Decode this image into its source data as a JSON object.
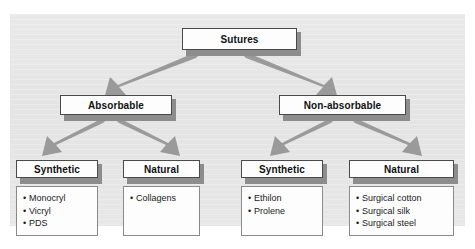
{
  "figure": {
    "root_label": "Sutures",
    "panel_color": "#e6e6e6",
    "box_fill": "#fdfdfd",
    "box_border": "#4a4a4a",
    "shadow_color": "#8d8d8d",
    "arrow_color": "#9a9a9a"
  },
  "level2": {
    "left": {
      "label": "Absorbable"
    },
    "right": {
      "label": "Non-absorbable"
    }
  },
  "level3": {
    "absorbable_synthetic": {
      "label": "Synthetic",
      "items": [
        "Monocryl",
        "Vicryl",
        "PDS"
      ]
    },
    "absorbable_natural": {
      "label": "Natural",
      "items": [
        "Collagens"
      ]
    },
    "nonabsorbable_synthetic": {
      "label": "Synthetic",
      "items": [
        "Ethilon",
        "Prolene"
      ]
    },
    "nonabsorbable_natural": {
      "label": "Natural",
      "items": [
        "Surgical cotton",
        "Surgical silk",
        "Surgical steel"
      ]
    }
  },
  "bullet": {
    "glyph": "•"
  }
}
